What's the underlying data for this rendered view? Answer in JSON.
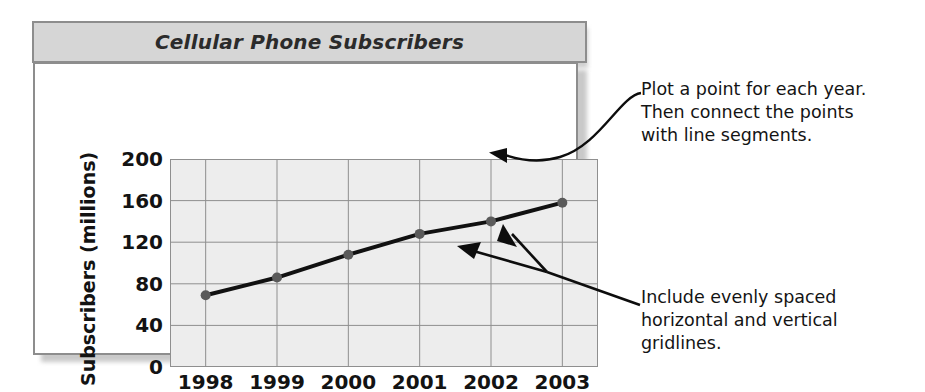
{
  "chart_data": {
    "type": "line",
    "title": "Cellular Phone Subscribers",
    "xlabel": "",
    "ylabel": "Subscribers (millions)",
    "categories": [
      "1998",
      "1999",
      "2000",
      "2001",
      "2002",
      "2003"
    ],
    "values": [
      69,
      86,
      108,
      128,
      140,
      158
    ],
    "series": [
      {
        "name": "Cellular Phone Subscribers",
        "values": [
          69,
          86,
          108,
          128,
          140,
          158
        ]
      }
    ],
    "ylim": [
      0,
      200
    ],
    "yticks": [
      0,
      40,
      80,
      120,
      160,
      200
    ],
    "ytick_labels": [
      "0",
      "40",
      "80",
      "120",
      "160",
      "200"
    ],
    "xtick_labels": [
      "1998",
      "1999",
      "2000",
      "2001",
      "2002",
      "2003"
    ],
    "grid": true,
    "grid_horizontal": true,
    "grid_vertical": true,
    "legend": false,
    "legend_position": "none",
    "marker": "filled-circle",
    "line_color": "#111111",
    "marker_color": "#5a5a5a",
    "plot_background": "#ededed",
    "title_background": "#d6d6d6",
    "frame_color": "#8d8d8d"
  },
  "annotations": [
    {
      "id": "annotation-1",
      "text": "Plot a point for each year.\nThen connect the points\nwith line segments.",
      "points_to": "data-point-2003"
    },
    {
      "id": "annotation-2",
      "text": "Include evenly spaced\nhorizontal and vertical\ngridlines.",
      "points_to": "gridlines"
    }
  ],
  "colors": {
    "text": "#131313",
    "line": "#111111",
    "marker": "#5a5a5a",
    "grid": "#8f8f8f",
    "plot_bg": "#ededed",
    "title_bg": "#d6d6d6",
    "border": "#8d8d8d"
  }
}
